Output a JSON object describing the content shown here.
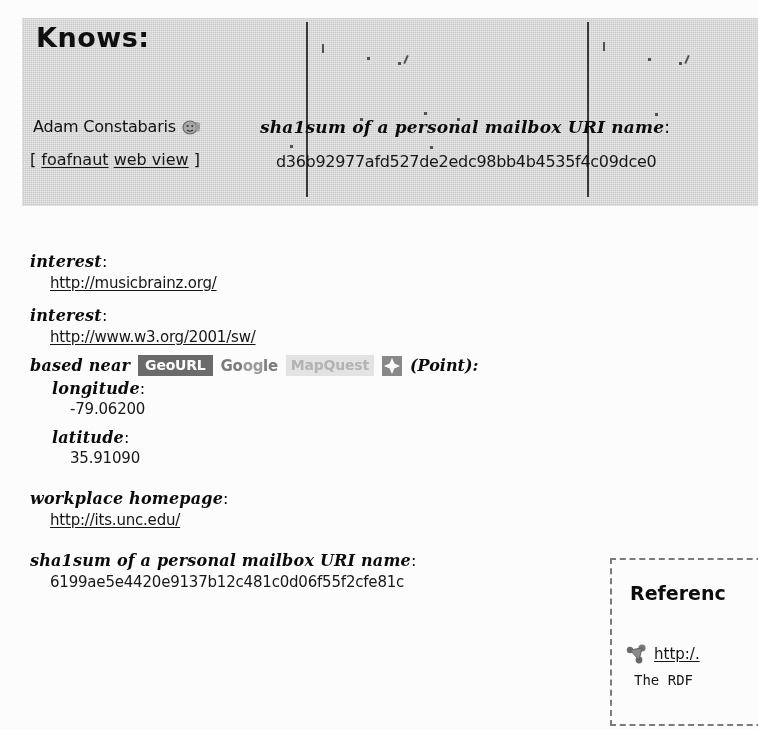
{
  "page": {
    "background_color": "#ffffff",
    "panel_color": "#d4d4d4"
  },
  "header": {
    "title": "Knows:",
    "person": {
      "name": "Adam Constabaris",
      "icon": "person-smiley-icon",
      "links_open_bracket": "[",
      "links_close_bracket": "]",
      "links": [
        {
          "label": "foafnaut"
        },
        {
          "label": "web view"
        }
      ]
    },
    "sha1_property": {
      "label": "sha1sum of a personal mailbox URI name",
      "colon": ":",
      "value": "d36b92977afd527de2edc98bb4b4535f4c09dce0"
    }
  },
  "properties": [
    {
      "label": "interest",
      "colon": ":",
      "value": "http://musicbrainz.org/",
      "kind": "link"
    },
    {
      "label": "interest",
      "colon": ":",
      "value": "http://www.w3.org/2001/sw/",
      "kind": "link"
    }
  ],
  "based_near": {
    "label": "based near",
    "colon": "",
    "badges": [
      {
        "name": "GeoURL",
        "style": "dark"
      },
      {
        "name": "Google",
        "style": "gray"
      },
      {
        "name": "MapQuest",
        "style": "light"
      }
    ],
    "map_icon": "map-marker-icon",
    "point_text": "(Point):",
    "fields": [
      {
        "label": "longitude",
        "colon": ":",
        "value": "-79.06200"
      },
      {
        "label": "latitude",
        "colon": ":",
        "value": "35.91090"
      }
    ]
  },
  "workplace": {
    "label": "workplace homepage",
    "colon": ":",
    "value": "http://its.unc.edu/"
  },
  "mbox_sha1": {
    "label": "sha1sum of a personal mailbox URI name",
    "colon": ":",
    "value": "6199ae5e4420e9137b12c481c0d06f55f2cfe81c"
  },
  "references": {
    "title": "Referenc",
    "icon": "rdf-graph-icon",
    "link": "http:/.",
    "subtext": "The RDF "
  },
  "colors": {
    "panel": "#d4d4d4",
    "geourl_badge_bg": "#6e6e6e",
    "geourl_badge_fg": "#ffffff",
    "google_fg": "#7e7e7e",
    "mapquest_bg": "#e2e2e2",
    "mapquest_fg": "#b4b4b4",
    "map_icon_bg": "#8a8a8a",
    "text": "#141414",
    "link": "#1b1b1b",
    "refs_border": "#7d7d7d"
  }
}
